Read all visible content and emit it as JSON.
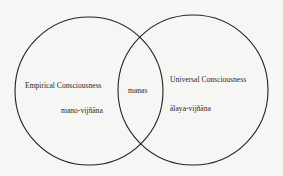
{
  "diagram": {
    "type": "venn",
    "colors": {
      "background": "#f6f6f4",
      "stroke": "#222222",
      "text": "#2a2a2a"
    },
    "left_circle": {
      "cx": 89,
      "cy": 91,
      "r": 74,
      "title": "Empirical Consciousness",
      "subtitle": "mano-vijñāna"
    },
    "right_circle": {
      "cx": 193,
      "cy": 90,
      "r": 75,
      "title": "Universal Consciousness",
      "subtitle": "ālaya-vijñāna"
    },
    "intersection": {
      "label": "manas"
    }
  }
}
